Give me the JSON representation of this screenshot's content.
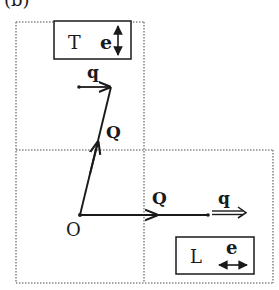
{
  "figure": {
    "panel_label": "(b)",
    "colors": {
      "ink": "#1a1a1a",
      "grid": "#8a8a8a",
      "background": "#ffffff"
    }
  },
  "origin": {
    "label": "O",
    "x": 80,
    "y": 215
  },
  "vectors": [
    {
      "name": "Q-transverse",
      "label": "Q",
      "from": [
        80,
        215
      ],
      "to": [
        111,
        86
      ],
      "style": "single"
    },
    {
      "name": "q-transverse",
      "label": "q",
      "from": [
        79,
        87
      ],
      "to": [
        111,
        87
      ],
      "style": "single"
    },
    {
      "name": "Q-longitudinal",
      "label": "Q",
      "from": [
        80,
        215
      ],
      "to": [
        208,
        215
      ],
      "style": "single"
    },
    {
      "name": "q-longitudinal",
      "label": "q",
      "from": [
        208,
        213
      ],
      "to": [
        246,
        213
      ],
      "style": "double"
    }
  ],
  "boxes": {
    "transverse": {
      "mode": "T",
      "polarization": "e",
      "arrow": "vertical"
    },
    "longitudinal": {
      "mode": "L",
      "polarization": "e",
      "arrow": "horizontal"
    }
  }
}
